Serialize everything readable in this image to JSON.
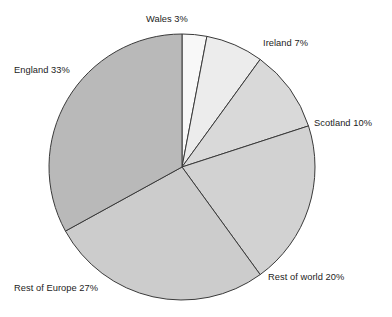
{
  "chart_data": {
    "type": "pie",
    "title": "",
    "subtitle": "",
    "xlabel": "",
    "ylabel": "",
    "legend_position": "none",
    "grid": false,
    "label_format": "{name} {value}%",
    "start_angle_deg": 0,
    "direction": "clockwise",
    "categories": [
      "Wales",
      "Ireland",
      "Scotland",
      "Rest of world",
      "Rest of Europe",
      "England"
    ],
    "values": [
      3,
      7,
      10,
      20,
      27,
      33
    ],
    "slice_colors": [
      "#f8f8f8",
      "#ececec",
      "#d9d9d9",
      "#d2d2d2",
      "#cccccc",
      "#b9b9b9"
    ],
    "slices": [
      {
        "name": "Wales",
        "value": 3,
        "label": "Wales 3%",
        "color": "#f8f8f8"
      },
      {
        "name": "Ireland",
        "value": 7,
        "label": "Ireland 7%",
        "color": "#ececec"
      },
      {
        "name": "Scotland",
        "value": 10,
        "label": "Scotland 10%",
        "color": "#d9d9d9"
      },
      {
        "name": "Rest of world",
        "value": 20,
        "label": "Rest of world 20%",
        "color": "#d2d2d2"
      },
      {
        "name": "Rest of Europe",
        "value": 27,
        "label": "Rest of Europe 27%",
        "color": "#cccccc"
      },
      {
        "name": "England",
        "value": 33,
        "label": "England 33%",
        "color": "#b9b9b9"
      }
    ]
  },
  "geometry": {
    "center_x": 182,
    "center_y": 167,
    "radius": 133,
    "stroke_color": "#3a3a3a",
    "stroke_width": 1
  },
  "labels": {
    "wales": "Wales 3%",
    "ireland": "Ireland 7%",
    "scotland": "Scotland 10%",
    "rest_of_world": "Rest of world 20%",
    "rest_of_europe": "Rest of Europe 27%",
    "england": "England 33%"
  }
}
